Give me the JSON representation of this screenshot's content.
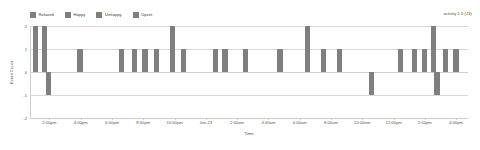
{
  "legend": {
    "position": "top-left",
    "items": [
      {
        "label": "Relaxed",
        "color": "#7f7f7f",
        "icon": "legend-swatch-icon"
      },
      {
        "label": "Happy",
        "color": "#7f7f7f",
        "icon": "legend-swatch-icon"
      },
      {
        "label": "Unhappy",
        "color": "#7f7f7f",
        "icon": "legend-swatch-icon"
      },
      {
        "label": "Upset",
        "color": "#7f7f7f",
        "icon": "legend-swatch-icon"
      }
    ]
  },
  "annotation": {
    "activity": "activity 1.0 (23)"
  },
  "axes": {
    "y_title": "Event Count",
    "x_title": "Time",
    "y_ticks": [
      "2",
      "1",
      "0",
      "-1",
      "-2"
    ],
    "x_ticks": [
      "2:00pm",
      "4:00pm",
      "6:00pm",
      "8:00pm",
      "10:00pm",
      "Jun 23",
      "2:00am",
      "4:00am",
      "6:00am",
      "8:00am",
      "10:00am",
      "12:00pm",
      "2:00pm",
      "4:00pm"
    ]
  },
  "chart_data": {
    "type": "bar",
    "title": "",
    "subtitle": "",
    "xlabel": "Time",
    "ylabel": "Event Count",
    "ylim": [
      -2,
      2
    ],
    "grid": true,
    "legend_position": "top-left",
    "bar_color": "#7f7f7f",
    "baseline": 0,
    "annotations": [
      "activity 1.0 (23)"
    ],
    "categories": [
      "2:00pm",
      "4:00pm",
      "6:00pm",
      "8:00pm",
      "10:00pm",
      "Jun 23",
      "2:00am",
      "4:00am",
      "6:00am",
      "8:00am",
      "10:00am",
      "12:00pm",
      "2:00pm",
      "4:00pm"
    ],
    "series": [
      {
        "name": "Event Count",
        "points": [
          {
            "x": "1:45pm",
            "value": 2
          },
          {
            "x": "1:55pm",
            "value": 2
          },
          {
            "x": "2:00pm",
            "value": -1
          },
          {
            "x": "3:40pm",
            "value": 1
          },
          {
            "x": "5:55pm",
            "value": 1
          },
          {
            "x": "6:40pm",
            "value": 1
          },
          {
            "x": "7:15pm",
            "value": 1
          },
          {
            "x": "7:55pm",
            "value": 1
          },
          {
            "x": "8:55pm",
            "value": 2
          },
          {
            "x": "9:15pm",
            "value": 1
          },
          {
            "x": "11:10pm",
            "value": 1
          },
          {
            "x": "11:40pm",
            "value": 1
          },
          {
            "x": "12:50am",
            "value": 1
          },
          {
            "x": "2:40am",
            "value": 1
          },
          {
            "x": "5:55am",
            "value": 1
          },
          {
            "x": "7:50am",
            "value": 2
          },
          {
            "x": "8:50am",
            "value": 1
          },
          {
            "x": "9:55am",
            "value": 1
          },
          {
            "x": "11:55am",
            "value": -1
          },
          {
            "x": "1:40pm",
            "value": 1
          },
          {
            "x": "2:45pm",
            "value": 1
          },
          {
            "x": "3:05pm",
            "value": 1
          },
          {
            "x": "3:20pm",
            "value": 2
          },
          {
            "x": "3:25pm",
            "value": -1
          },
          {
            "x": "3:45pm",
            "value": 1
          },
          {
            "x": "4:00pm",
            "value": 1
          }
        ]
      }
    ]
  },
  "layout": {
    "bars": [
      {
        "left_pct": 0.9,
        "value": 2
      },
      {
        "left_pct": 3.2,
        "value": 2
      },
      {
        "left_pct": 4.3,
        "value": -1
      },
      {
        "left_pct": 13.0,
        "value": 1
      },
      {
        "left_pct": 24.4,
        "value": 1
      },
      {
        "left_pct": 27.9,
        "value": 1
      },
      {
        "left_pct": 30.8,
        "value": 1
      },
      {
        "left_pct": 34.0,
        "value": 1
      },
      {
        "left_pct": 38.4,
        "value": 2
      },
      {
        "left_pct": 41.3,
        "value": 1
      },
      {
        "left_pct": 50.0,
        "value": 1
      },
      {
        "left_pct": 52.7,
        "value": 1
      },
      {
        "left_pct": 58.4,
        "value": 1
      },
      {
        "left_pct": 67.8,
        "value": 1
      },
      {
        "left_pct": 75.3,
        "value": 2
      },
      {
        "left_pct": 79.7,
        "value": 1
      },
      {
        "left_pct": 84.0,
        "value": 1
      },
      {
        "left_pct": 92.9,
        "value": -1
      },
      {
        "left_pct": 100.8,
        "value": 1
      },
      {
        "left_pct": 104.6,
        "value": 1
      },
      {
        "left_pct": 107.4,
        "value": 1
      },
      {
        "left_pct": 109.8,
        "value": 2
      },
      {
        "left_pct": 110.8,
        "value": -1
      },
      {
        "left_pct": 113.2,
        "value": 1
      },
      {
        "left_pct": 116.0,
        "value": 1
      }
    ]
  }
}
